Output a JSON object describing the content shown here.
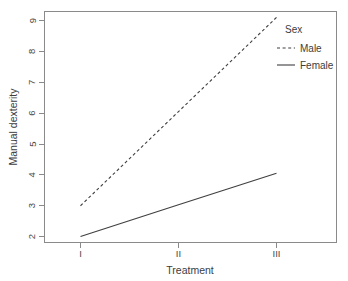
{
  "chart_data": {
    "type": "line",
    "title": "",
    "xlabel": "Treatment",
    "ylabel": "Manual dexterity",
    "categories": [
      "I",
      "II",
      "III"
    ],
    "x_tick_labels": [
      "I",
      "II",
      "III"
    ],
    "y_tick_labels": [
      "2",
      "3",
      "4",
      "5",
      "6",
      "7",
      "8",
      "9"
    ],
    "y_ticks": [
      2,
      3,
      4,
      5,
      6,
      7,
      8,
      9
    ],
    "ylim": [
      1.85,
      9.25
    ],
    "grid": false,
    "legend_position": "top-right-inside",
    "legend_title": "Sex",
    "series": [
      {
        "name": "Male",
        "style": "dashed",
        "color": "#3f3f3f",
        "values": [
          3.0,
          6.05,
          9.1
        ]
      },
      {
        "name": "Female",
        "style": "solid",
        "color": "#3f3f3f",
        "values": [
          2.0,
          3.03,
          4.05
        ]
      }
    ]
  },
  "axes": {
    "y_label": "Manual dexterity",
    "x_label": "Treatment",
    "y_tick_9": "9",
    "y_tick_8": "8",
    "y_tick_7": "7",
    "y_tick_6": "6",
    "y_tick_5": "5",
    "y_tick_4": "4",
    "y_tick_3": "3",
    "y_tick_2": "2",
    "x_tick_1": "I",
    "x_tick_2": "II",
    "x_tick_3": "III"
  },
  "legend": {
    "title": "Sex",
    "item_male": "Male",
    "item_female": "Female"
  }
}
